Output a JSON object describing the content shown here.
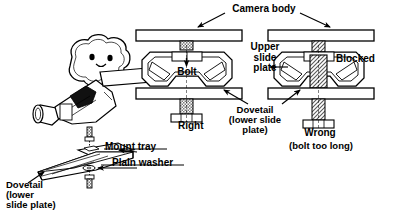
{
  "figure": {
    "kind": "technical-diagram",
    "background_color": "#ffffff",
    "line_color": "#000000",
    "hatch_color": "#7a7a7a"
  },
  "labels": {
    "camera_body": "Camera body",
    "upper_slide_plate": "Upper\nslide\nplate",
    "bolt": "Bolt",
    "blocked": "Blocked",
    "right": "Right",
    "wrong": "Wrong",
    "wrong_note": "(bolt too long)",
    "dovetail_center": "Dovetail\n(lower slide\nplate)",
    "dovetail_left": "Dovetail\n(lower\nslide plate)",
    "mount_tray": "Mount tray",
    "plain_washer": "Plain washer"
  },
  "left_illustration": {
    "name": "camcorder-exploded-view",
    "parts": [
      "camcorder",
      "screw",
      "mount-tray",
      "plain-washer",
      "dovetail-plate",
      "bolt"
    ],
    "camera_face": {
      "eyes": 2,
      "mouth": "smile"
    }
  },
  "cross_sections": [
    {
      "name": "right-assembly",
      "verdict": "Right",
      "bolt_length": "correct",
      "parts": [
        "camera-body-plate",
        "bolt",
        "upper-slide-plate",
        "dovetail-lower-slide-plate",
        "bolt-head"
      ],
      "blocked": false
    },
    {
      "name": "wrong-assembly",
      "verdict": "Wrong",
      "note": "(bolt too long)",
      "bolt_length": "too long",
      "parts": [
        "camera-body-plate",
        "bolt",
        "upper-slide-plate",
        "dovetail-lower-slide-plate",
        "bolt-head"
      ],
      "blocked": true,
      "blocked_label": "Blocked"
    }
  ],
  "callouts": [
    {
      "label": "Camera body",
      "targets": [
        "right-assembly-top-plate",
        "wrong-assembly-top-plate"
      ]
    },
    {
      "label": "Upper slide plate",
      "targets": [
        "right-assembly-upper-plate"
      ]
    },
    {
      "label": "Bolt",
      "targets": [
        "right-assembly-bolt"
      ]
    },
    {
      "label": "Blocked",
      "targets": [
        "wrong-assembly-bolt-interference"
      ]
    },
    {
      "label": "Dovetail (lower slide plate)",
      "targets": [
        "right-assembly-lower-plate",
        "wrong-assembly-lower-plate"
      ]
    },
    {
      "label": "Mount tray",
      "targets": [
        "mount-tray-part"
      ]
    },
    {
      "label": "Plain washer",
      "targets": [
        "plain-washer-part"
      ]
    },
    {
      "label": "Dovetail (lower slide plate)",
      "targets": [
        "dovetail-plate-part"
      ]
    }
  ]
}
